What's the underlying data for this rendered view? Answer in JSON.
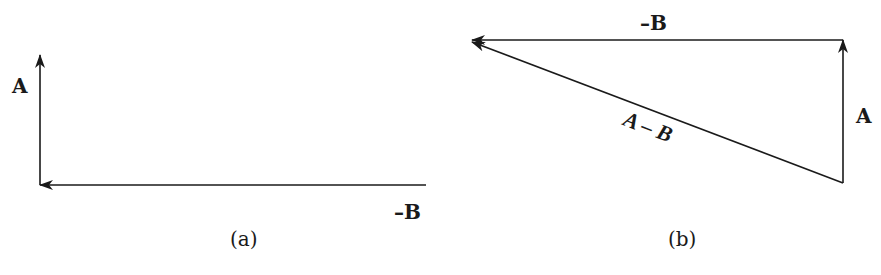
{
  "colors": {
    "ink": "#1a1a1a",
    "background": "#ffffff"
  },
  "panel_a": {
    "caption": "(a)",
    "labels": {
      "A": "A",
      "minus_B": "–B"
    },
    "vectors": [
      {
        "name": "A",
        "from": [
          40,
          185
        ],
        "to": [
          40,
          55
        ]
      },
      {
        "name": "-B",
        "from": [
          426,
          185
        ],
        "to": [
          40,
          185
        ]
      }
    ]
  },
  "panel_b": {
    "caption": "(b)",
    "labels": {
      "A": "A",
      "minus_B": "–B",
      "A_minus_B": "A – B"
    },
    "vectors": [
      {
        "name": "A",
        "from": [
          843,
          183
        ],
        "to": [
          843,
          40
        ]
      },
      {
        "name": "-B",
        "from": [
          843,
          40
        ],
        "to": [
          470,
          40
        ]
      },
      {
        "name": "A-B",
        "from": [
          843,
          183
        ],
        "to": [
          470,
          42
        ]
      }
    ]
  }
}
